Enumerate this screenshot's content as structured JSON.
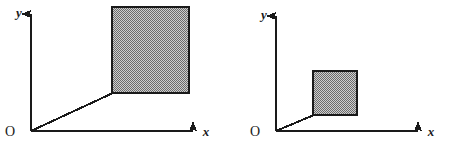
{
  "figure": {
    "name": "two-perspective-square-diagrams",
    "background_color": "#ffffff",
    "width": 450,
    "height": 152,
    "stroke_color": "#1a1a1a",
    "fill_color": "#a8a8a8",
    "fill_pattern": "checkerboard-dither"
  },
  "panels": [
    {
      "id": "left",
      "name": "left-diagram",
      "labels": {
        "y_axis": "y",
        "x_axis": "x",
        "origin": "O"
      },
      "origin": {
        "x": 31,
        "y": 131
      },
      "y_axis": {
        "x1": 31,
        "y1": 131,
        "x2": 31,
        "y2": 14
      },
      "x_axis": {
        "x1": 31,
        "y1": 131,
        "x2": 193,
        "y2": 131
      },
      "y_label_pos": {
        "x": 19,
        "y": 17
      },
      "x_label_pos": {
        "x": 206,
        "y": 136
      },
      "origin_label_pos": {
        "x": 10,
        "y": 136
      },
      "square": {
        "x": 112,
        "y": 7,
        "width": 77,
        "height": 86
      },
      "connector": {
        "x1": 31,
        "y1": 131,
        "x2": 112,
        "y2": 93
      }
    },
    {
      "id": "right",
      "name": "right-diagram",
      "labels": {
        "y_axis": "y",
        "x_axis": "x",
        "origin": "O"
      },
      "origin": {
        "x": 276,
        "y": 131
      },
      "y_axis": {
        "x1": 276,
        "y1": 131,
        "x2": 276,
        "y2": 16
      },
      "x_axis": {
        "x1": 276,
        "y1": 131,
        "x2": 418,
        "y2": 131
      },
      "y_label_pos": {
        "x": 264,
        "y": 19
      },
      "x_label_pos": {
        "x": 431,
        "y": 136
      },
      "origin_label_pos": {
        "x": 255,
        "y": 136
      },
      "square": {
        "x": 313,
        "y": 71,
        "width": 44,
        "height": 44
      },
      "connector": {
        "x1": 276,
        "y1": 131,
        "x2": 313,
        "y2": 115
      }
    }
  ]
}
